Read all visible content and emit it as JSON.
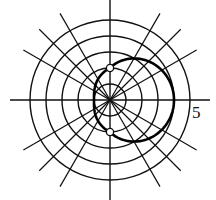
{
  "chart_data": {
    "type": "polar",
    "title": "",
    "center_px": [
      110,
      100
    ],
    "ring_spacing_px": 16,
    "rings": [
      1,
      2,
      3,
      4,
      5
    ],
    "spokes_deg": [
      0,
      30,
      45,
      60,
      90,
      120,
      135,
      150,
      180,
      210,
      225,
      240,
      270,
      300,
      315,
      330
    ],
    "radial_tick_label": {
      "text": "5",
      "r": 5,
      "angle_deg": 0
    },
    "curve": {
      "description": "closed curve r(θ): r(0)=4, r(±90°)=2, r(180°)=1",
      "right_half": "r = 2 + 2cosθ, θ ∈ [-90°, 90°]",
      "left_half": "r = 2 + cosθ, θ ∈ [90°, 270°]",
      "points": [
        {
          "theta_deg": 0,
          "r": 4
        },
        {
          "theta_deg": 90,
          "r": 2
        },
        {
          "theta_deg": 180,
          "r": 1
        },
        {
          "theta_deg": 270,
          "r": 2
        }
      ],
      "color": "#000000",
      "stroke_width": 2.6
    },
    "marked_points": [
      {
        "x": 0,
        "y": 2,
        "style": "open-circle"
      },
      {
        "x": 0,
        "y": -2,
        "style": "open-circle"
      }
    ],
    "grid_color": "#000000",
    "background": "#ffffff"
  },
  "labels": {
    "tick_5": "5"
  }
}
